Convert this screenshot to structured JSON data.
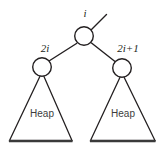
{
  "diagram": {
    "background_color": "#ffffff",
    "stroke_color": "#231f20",
    "nodes": [
      {
        "id": "root",
        "label": "i",
        "cx": 84,
        "cy": 36,
        "r": 9.5
      },
      {
        "id": "left-child",
        "label": "2i",
        "cx": 42,
        "cy": 67,
        "r": 9.5
      },
      {
        "id": "right-child",
        "label": "2i+1",
        "cx": 122,
        "cy": 68,
        "r": 9.5
      }
    ],
    "labels": {
      "root": "i",
      "left_child": "2i",
      "right_child": "2i+1",
      "left_subtree": "Heap",
      "right_subtree": "Heap"
    },
    "subtrees": [
      {
        "id": "left-subtree",
        "label": "Heap",
        "apex_x": 42,
        "apex_y": 72,
        "base_left_x": 9,
        "base_right_x": 72,
        "base_y": 141
      },
      {
        "id": "right-subtree",
        "label": "Heap",
        "apex_x": 122,
        "apex_y": 73,
        "base_left_x": 90,
        "base_right_x": 155,
        "base_y": 141
      }
    ],
    "edges": [
      {
        "id": "parent-edge",
        "from": "root",
        "to": "parent-above",
        "x1": 91,
        "y1": 30,
        "x2": 106,
        "y2": 15
      },
      {
        "id": "root-to-left-edge",
        "from": "root",
        "to": "left-child",
        "x1": 76,
        "y1": 43,
        "x2": 49,
        "y2": 61
      },
      {
        "id": "root-to-right-edge",
        "from": "root",
        "to": "right-child",
        "x1": 92,
        "y1": 43,
        "x2": 115,
        "y2": 62
      }
    ]
  }
}
